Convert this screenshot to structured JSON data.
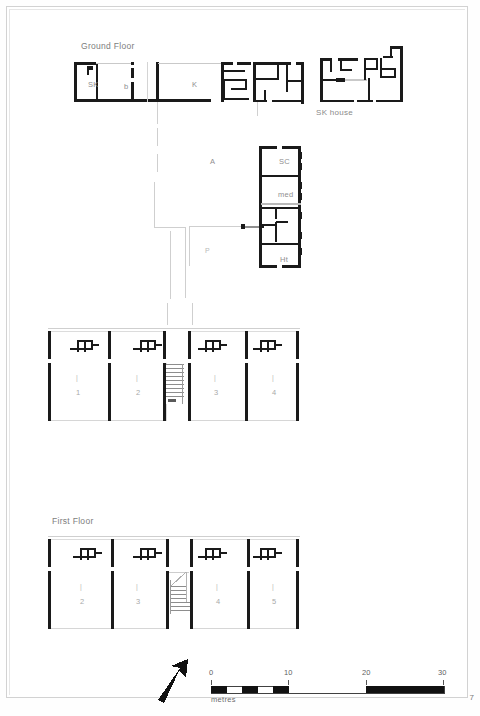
{
  "page": {
    "number": "7",
    "domain_note": "architectural floor plan sheet"
  },
  "sections": [
    {
      "id": "ground",
      "label": "Ground Floor",
      "x": 81,
      "y": 41
    },
    {
      "id": "first",
      "label": "First Floor",
      "x": 52,
      "y": 516
    }
  ],
  "annotations": {
    "sk_house": {
      "label": "SK house",
      "x": 316,
      "y": 108
    }
  },
  "rooms": [
    {
      "name": "SK",
      "label": "SK",
      "x": 88,
      "y": 80
    },
    {
      "name": "b",
      "label": "b",
      "x": 124,
      "y": 82
    },
    {
      "name": "K",
      "label": "K",
      "x": 192,
      "y": 80
    },
    {
      "name": "A",
      "label": "A",
      "x": 210,
      "y": 157
    },
    {
      "name": "SC",
      "label": "SC",
      "x": 279,
      "y": 157
    },
    {
      "name": "med",
      "label": "med",
      "x": 278,
      "y": 190
    },
    {
      "name": "Ht",
      "label": "Ht",
      "x": 280,
      "y": 255
    },
    {
      "name": "P",
      "label": "P",
      "x": 205,
      "y": 247
    }
  ],
  "ground_floor_units": [
    {
      "id": "u1",
      "number": "1",
      "x": 76,
      "y": 388
    },
    {
      "id": "u2",
      "number": "2",
      "x": 136,
      "y": 388
    },
    {
      "id": "u3",
      "number": "3",
      "x": 214,
      "y": 388
    },
    {
      "id": "u4",
      "number": "4",
      "x": 272,
      "y": 388
    }
  ],
  "ground_floor_unit_marks": [
    {
      "x": 76,
      "y": 374
    },
    {
      "x": 136,
      "y": 374
    },
    {
      "x": 214,
      "y": 374
    },
    {
      "x": 272,
      "y": 374
    }
  ],
  "first_floor_units": [
    {
      "id": "f2",
      "number": "2",
      "x": 80,
      "y": 597
    },
    {
      "id": "f3",
      "number": "3",
      "x": 136,
      "y": 597
    },
    {
      "id": "f4",
      "number": "4",
      "x": 216,
      "y": 597
    },
    {
      "id": "f5",
      "number": "5",
      "x": 272,
      "y": 597
    }
  ],
  "first_floor_unit_marks": [
    {
      "x": 80,
      "y": 583
    },
    {
      "x": 136,
      "y": 583
    },
    {
      "x": 216,
      "y": 583
    },
    {
      "x": 272,
      "y": 583
    }
  ],
  "scale_bar": {
    "unit_label": "metres",
    "ticks": [
      "0",
      "10",
      "20",
      "30"
    ],
    "x": 211,
    "y": 686,
    "width": 233,
    "height": 7,
    "segments_first_decade": 5
  },
  "north_arrow": {
    "name": "north-arrow",
    "x": 158,
    "y": 660
  },
  "colors": {
    "wall": "#1a1a1a",
    "wall_light": "#d8d8d8",
    "grid_line": "#cfcfcf",
    "text": "#8a8a8a",
    "paper": "#ffffff",
    "frame": "#d2d2d2"
  }
}
